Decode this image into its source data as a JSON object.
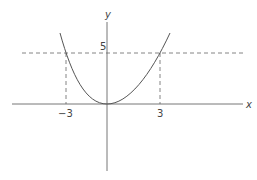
{
  "diagram": {
    "title": "",
    "axes": {
      "x_label": "x",
      "y_label": "y"
    },
    "curve": {
      "equation_shape": "parabola opening upward, vertex at origin",
      "color": "#555555"
    },
    "annotations": {
      "y_tick": "5",
      "x_tick_left": "−3",
      "x_tick_right": "3"
    },
    "guides": {
      "horizontal_dashed_at_y": 5,
      "vertical_dashed_at_x": [
        -3,
        3
      ]
    },
    "colors": {
      "axis": "#777777",
      "dashed": "#666666",
      "text": "#444444"
    }
  }
}
